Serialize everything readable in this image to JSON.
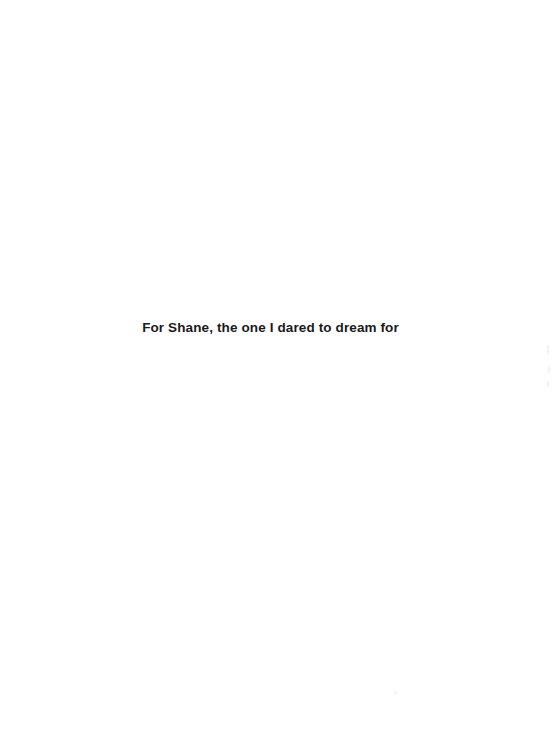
{
  "page": {
    "kind": "book-dedication-page",
    "width": 553,
    "height": 753,
    "background_color": "#ffffff"
  },
  "dedication": {
    "text": "For Shane, the one I dared to dream for",
    "text_color": "#1a1a1a",
    "alignment": "center"
  }
}
